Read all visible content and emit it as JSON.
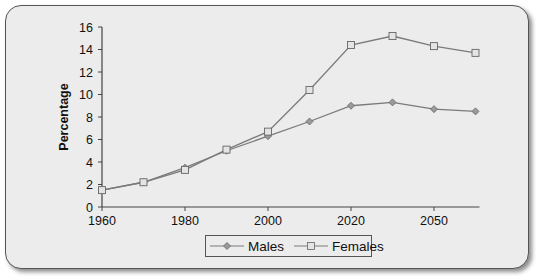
{
  "chart_data": {
    "type": "line",
    "title": "",
    "xlabel": "",
    "ylabel": "Percentage",
    "ylim": [
      0,
      16
    ],
    "yticks": [
      0,
      2,
      4,
      6,
      8,
      10,
      12,
      14,
      16
    ],
    "x_positions": 10,
    "xtick_labels": [
      {
        "index": 0,
        "label": "1960"
      },
      {
        "index": 2,
        "label": "1980"
      },
      {
        "index": 4,
        "label": "2000"
      },
      {
        "index": 6,
        "label": "2020"
      },
      {
        "index": 8,
        "label": "2050"
      }
    ],
    "series": [
      {
        "name": "Males",
        "marker": "diamond",
        "color": "#7a7a7a",
        "values": [
          1.5,
          2.2,
          3.5,
          5.0,
          6.3,
          7.6,
          9.0,
          9.3,
          8.7,
          8.5
        ]
      },
      {
        "name": "Females",
        "marker": "square",
        "color": "#7a7a7a",
        "values": [
          1.5,
          2.2,
          3.3,
          5.1,
          6.7,
          10.4,
          14.4,
          15.2,
          14.3,
          13.7
        ]
      }
    ],
    "grid": false,
    "legend_position": "bottom"
  },
  "legend": {
    "males_label": "Males",
    "females_label": "Females"
  }
}
